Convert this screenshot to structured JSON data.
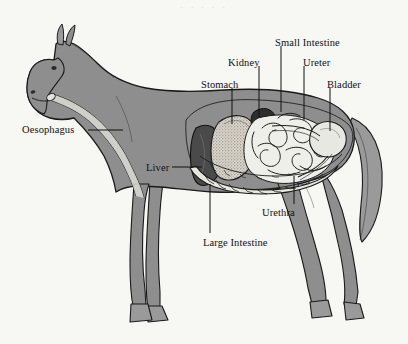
{
  "figure": {
    "background_color": "#f7f7f4",
    "body_fill": "#8e8e8e",
    "outline_color": "#1a1a1a",
    "top_fragment_text": ". . . . ."
  },
  "labels": [
    {
      "id": "stomach",
      "text": "Stomach",
      "x": 201,
      "y": 80,
      "align": "left",
      "line": {
        "x1": 232,
        "y1": 88,
        "x2": 232,
        "y2": 124
      }
    },
    {
      "id": "kidney",
      "text": "Kidney",
      "x": 228,
      "y": 58,
      "align": "left",
      "line": {
        "x1": 259,
        "y1": 66,
        "x2": 259,
        "y2": 117
      }
    },
    {
      "id": "small-intestine",
      "text": "Small Intestine",
      "x": 275,
      "y": 38,
      "align": "left",
      "line": {
        "x1": 281,
        "y1": 46,
        "x2": 281,
        "y2": 112
      }
    },
    {
      "id": "ureter",
      "text": "Ureter",
      "x": 303,
      "y": 58,
      "align": "left",
      "line": {
        "x1": 304,
        "y1": 66,
        "x2": 304,
        "y2": 120
      }
    },
    {
      "id": "bladder",
      "text": "Bladder",
      "x": 327,
      "y": 80,
      "align": "left",
      "line": {
        "x1": 330,
        "y1": 88,
        "x2": 330,
        "y2": 131
      }
    },
    {
      "id": "oesophagus",
      "text": "Oesophagus",
      "x": 22,
      "y": 125,
      "align": "left",
      "line": {
        "x1": 88,
        "y1": 130,
        "x2": 123,
        "y2": 130
      }
    },
    {
      "id": "liver",
      "text": "Liver",
      "x": 146,
      "y": 163,
      "align": "left",
      "line": {
        "x1": 172,
        "y1": 167,
        "x2": 202,
        "y2": 167
      }
    },
    {
      "id": "urethra",
      "text": "Urethra",
      "x": 262,
      "y": 208,
      "align": "left",
      "line": {
        "x1": 294,
        "y1": 204,
        "x2": 294,
        "y2": 176
      }
    },
    {
      "id": "large-intestine",
      "text": "Large Intestine",
      "x": 203,
      "y": 238,
      "align": "left",
      "line": {
        "x1": 210,
        "y1": 233,
        "x2": 210,
        "y2": 184
      }
    }
  ]
}
